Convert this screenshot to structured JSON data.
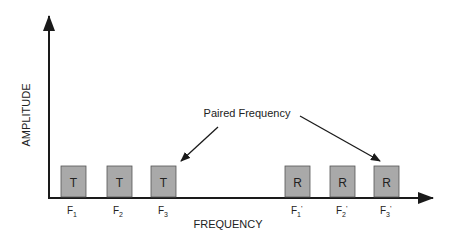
{
  "diagram": {
    "y_axis_label": "AMPLITUDE",
    "x_axis_label": "FREQUENCY",
    "annotation": "Paired Frequency",
    "colors": {
      "box_fill": "#a9a9a9",
      "box_stroke": "#555555",
      "axis": "#1a1a1a"
    },
    "transmit_boxes": [
      {
        "letter": "T",
        "freq": "F",
        "sub": "1",
        "prime": ""
      },
      {
        "letter": "T",
        "freq": "F",
        "sub": "2",
        "prime": ""
      },
      {
        "letter": "T",
        "freq": "F",
        "sub": "3",
        "prime": ""
      }
    ],
    "receive_boxes": [
      {
        "letter": "R",
        "freq": "F",
        "sub": "1",
        "prime": "'"
      },
      {
        "letter": "R",
        "freq": "F",
        "sub": "2",
        "prime": "'"
      },
      {
        "letter": "R",
        "freq": "F",
        "sub": "3",
        "prime": "'"
      }
    ]
  }
}
